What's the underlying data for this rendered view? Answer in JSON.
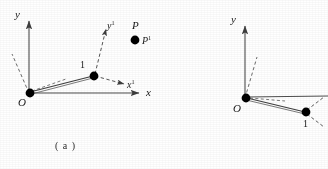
{
  "figure": {
    "caption": "( a )",
    "stroke_color": "#4d4d4d",
    "node_color": "#000000",
    "label_color": "#1a1a1a"
  },
  "panel_a": {
    "name": "left-panel",
    "axes": {
      "y_label": "y",
      "x_label": "x"
    },
    "local_axes": {
      "x_local_label": "x",
      "x_local_sup": "1",
      "y_local_label": "y",
      "y_local_sup": "1"
    },
    "nodes": [
      {
        "label": "O",
        "role": "origin-node"
      },
      {
        "label": "1",
        "role": "element-node"
      }
    ],
    "points": [
      {
        "label": "P",
        "role": "point-p-global"
      },
      {
        "label": "P",
        "sup": "1",
        "role": "point-p-local"
      }
    ]
  },
  "panel_b": {
    "name": "right-panel",
    "axes": {
      "y_label": "y"
    },
    "nodes": [
      {
        "label": "O",
        "role": "origin-node"
      },
      {
        "label": "1",
        "role": "element-node"
      }
    ]
  }
}
